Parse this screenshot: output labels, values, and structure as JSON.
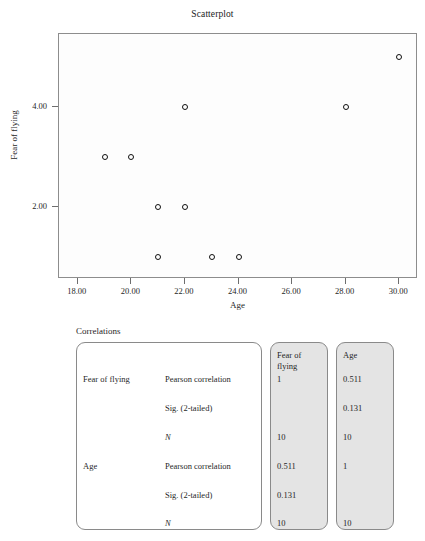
{
  "chart_data": {
    "type": "scatter",
    "title": "Scatterplot",
    "xlabel": "Age",
    "ylabel": "Fear of flying",
    "xlim": [
      17.3,
      30.7
    ],
    "ylim": [
      0.55,
      5.45
    ],
    "grid": false,
    "legend": null,
    "xticks": [
      "18.00",
      "20.00",
      "22.00",
      "24.00",
      "26.00",
      "28.00",
      "30.00"
    ],
    "xtick_values": [
      18,
      20,
      22,
      24,
      26,
      28,
      30
    ],
    "yticks": [
      "2.00",
      "4.00"
    ],
    "ytick_values": [
      2,
      4
    ],
    "series": [
      {
        "name": "Fear of flying vs Age",
        "x": [
          19,
          20,
          21,
          21,
          22,
          22,
          23,
          24,
          28,
          30
        ],
        "y": [
          3,
          3,
          2,
          1,
          4,
          2,
          1,
          1,
          4,
          5
        ]
      }
    ]
  },
  "table": {
    "caption": "Correlations",
    "column_headers": [
      "Fear of flying",
      "Age"
    ],
    "rows": [
      {
        "variable": "Fear of flying",
        "stat": "Pearson correlation",
        "italic": false,
        "values": [
          "1",
          "0.511"
        ]
      },
      {
        "variable": "",
        "stat": "Sig. (2-tailed)",
        "italic": false,
        "values": [
          "",
          "0.131"
        ]
      },
      {
        "variable": "",
        "stat": "N",
        "italic": true,
        "values": [
          "10",
          "10"
        ]
      },
      {
        "variable": "Age",
        "stat": "Pearson correlation",
        "italic": false,
        "values": [
          "0.511",
          "1"
        ]
      },
      {
        "variable": "",
        "stat": "Sig. (2-tailed)",
        "italic": false,
        "values": [
          "0.131",
          ""
        ]
      },
      {
        "variable": "",
        "stat": "N",
        "italic": true,
        "values": [
          "10",
          "10"
        ]
      }
    ]
  }
}
